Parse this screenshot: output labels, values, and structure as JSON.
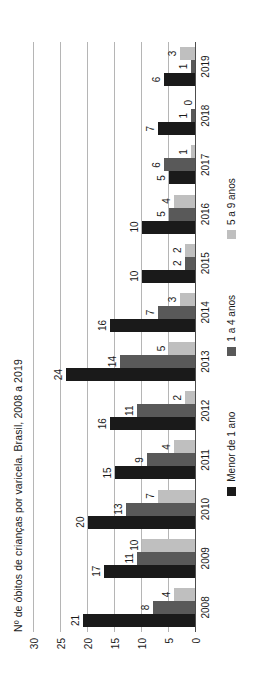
{
  "chart_data": {
    "type": "bar",
    "title": "Nº de óbitos de crianças por varicela. Brasil, 2008 a 2019",
    "xlabel": "",
    "ylabel": "",
    "ylim": [
      0,
      30
    ],
    "yticks": [
      0,
      5,
      10,
      15,
      20,
      25,
      30
    ],
    "grid": true,
    "legend_position": "bottom",
    "orientation": "vertical",
    "categories": [
      "2008",
      "2009",
      "2010",
      "2011",
      "2012",
      "2013",
      "2014",
      "2015",
      "2016",
      "2017",
      "2018",
      "2019"
    ],
    "series": [
      {
        "name": "Menor de 1 ano",
        "color": "#1a1a1a",
        "values": [
          21,
          17,
          20,
          15,
          16,
          24,
          16,
          10,
          10,
          5,
          7,
          6
        ]
      },
      {
        "name": "1 a 4 anos",
        "color": "#595959",
        "values": [
          8,
          11,
          13,
          9,
          11,
          14,
          7,
          2,
          5,
          6,
          1,
          1
        ]
      },
      {
        "name": "5 a 9 anos",
        "color": "#bfbfbf",
        "values": [
          4,
          10,
          7,
          4,
          2,
          5,
          3,
          2,
          4,
          1,
          0,
          3
        ]
      }
    ]
  }
}
